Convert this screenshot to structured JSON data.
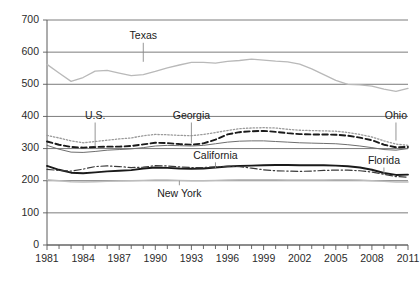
{
  "chart_data": {
    "type": "line",
    "title": "",
    "xlabel": "",
    "ylabel": "",
    "xlim": [
      1981,
      2011
    ],
    "ylim": [
      0,
      700
    ],
    "grid": true,
    "legend_position": "inline-labels",
    "y_ticks": [
      0,
      100,
      200,
      300,
      400,
      500,
      600,
      700
    ],
    "x_ticks_labeled": [
      1981,
      1984,
      1987,
      1990,
      1993,
      1996,
      1999,
      2002,
      2005,
      2008,
      2011
    ],
    "x_ticks_minor_step": 1,
    "x": [
      1981,
      1982,
      1983,
      1984,
      1985,
      1986,
      1987,
      1988,
      1989,
      1990,
      1991,
      1992,
      1993,
      1994,
      1995,
      1996,
      1997,
      1998,
      1999,
      2000,
      2001,
      2002,
      2003,
      2004,
      2005,
      2006,
      2007,
      2008,
      2009,
      2010,
      2011
    ],
    "series": [
      {
        "name": "Texas",
        "style": "solid",
        "color": "#b9b9b9",
        "width": 1.3,
        "label_x": 1989,
        "label_y_value": 640,
        "leader_to_value": 570,
        "values": [
          562,
          535,
          509,
          521,
          541,
          543,
          535,
          527,
          530,
          540,
          551,
          560,
          568,
          568,
          566,
          571,
          574,
          578,
          575,
          572,
          570,
          563,
          548,
          530,
          512,
          500,
          498,
          494,
          485,
          478,
          487
        ]
      },
      {
        "name": "Ohio",
        "style": "dotted",
        "color": "#9a9a9a",
        "width": 1.3,
        "label_x": 2010,
        "label_y_value": 392,
        "leader_to_value": 325,
        "values": [
          341,
          333,
          324,
          318,
          322,
          326,
          330,
          333,
          340,
          344,
          343,
          341,
          340,
          344,
          350,
          356,
          362,
          364,
          365,
          364,
          360,
          357,
          356,
          355,
          354,
          350,
          344,
          336,
          324,
          314,
          310
        ]
      },
      {
        "name": "Georgia",
        "style": "dashed",
        "color": "#1a1a1a",
        "width": 1.9,
        "label_x": 1993,
        "label_y_value": 392,
        "leader_to_value": 316,
        "values": [
          322,
          312,
          305,
          303,
          305,
          306,
          306,
          308,
          313,
          318,
          317,
          314,
          312,
          316,
          328,
          344,
          351,
          354,
          355,
          352,
          348,
          345,
          344,
          344,
          343,
          340,
          334,
          326,
          312,
          304,
          305
        ]
      },
      {
        "name": "U.S.",
        "style": "solid",
        "color": "#6e6e6e",
        "width": 1.0,
        "label_x": 1985,
        "label_y_value": 392,
        "leader_to_value": 306,
        "values": [
          310,
          298,
          289,
          288,
          291,
          295,
          297,
          299,
          303,
          308,
          310,
          309,
          308,
          310,
          315,
          320,
          323,
          324,
          324,
          322,
          320,
          318,
          317,
          316,
          315,
          312,
          308,
          303,
          297,
          295,
          300
        ]
      },
      {
        "name": "Florida",
        "style": "solid",
        "color": "#1a1a1a",
        "width": 1.9,
        "label_x": 2009,
        "label_y_value": 252,
        "leader_to_value": 219,
        "values": [
          246,
          234,
          225,
          223,
          226,
          229,
          231,
          233,
          238,
          241,
          240,
          238,
          237,
          238,
          241,
          244,
          246,
          247,
          248,
          249,
          249,
          248,
          248,
          248,
          247,
          245,
          241,
          234,
          224,
          218,
          219
        ]
      },
      {
        "name": "California",
        "style": "dashdot",
        "color": "#3a3a3a",
        "width": 1.2,
        "label_x": 1995,
        "label_y_value": 268,
        "leader_to_value": 238,
        "values": [
          235,
          232,
          230,
          236,
          244,
          246,
          244,
          241,
          242,
          247,
          246,
          243,
          241,
          241,
          243,
          245,
          244,
          239,
          234,
          231,
          230,
          229,
          230,
          232,
          233,
          233,
          231,
          227,
          220,
          213,
          211
        ]
      },
      {
        "name": "New York",
        "style": "solid",
        "color": "#bdbdbd",
        "width": 1.4,
        "label_x": 1992,
        "label_y_value": 150,
        "leader_to_value": 200,
        "values": [
          203,
          200,
          197,
          196,
          197,
          198,
          199,
          200,
          201,
          202,
          202,
          201,
          200,
          200,
          201,
          202,
          203,
          203,
          203,
          203,
          202,
          202,
          202,
          202,
          203,
          203,
          202,
          200,
          198,
          196,
          196
        ]
      }
    ]
  }
}
